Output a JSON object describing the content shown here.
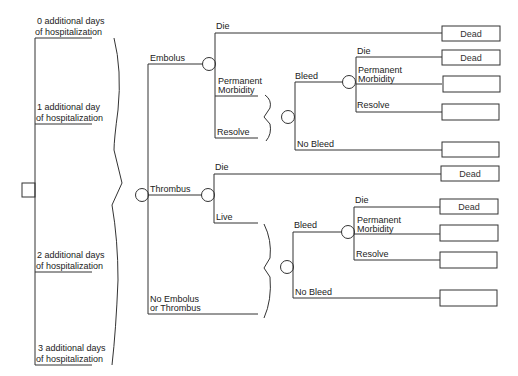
{
  "diagram": {
    "type": "decision-tree",
    "hospitalization_options": [
      {
        "line1": "0 additional days",
        "line2": "of hospitalization"
      },
      {
        "line1": "1 additional day",
        "line2": "of hospitalization"
      },
      {
        "line1": "2 additional days",
        "line2": "of hospitalization"
      },
      {
        "line1": "3 additional days",
        "line2": "of hospitalization"
      }
    ],
    "events": {
      "embolus": "Embolus",
      "thrombus": "Thrombus",
      "none_line1": "No Embolus",
      "none_line2": "or Thrombus"
    },
    "embolus_branch": {
      "die": "Die",
      "perm_line1": "Permanent",
      "perm_line2": "Morbidity",
      "resolve": "Resolve",
      "bleed": "Bleed",
      "no_bleed": "No Bleed",
      "bleed_die": "Die",
      "bleed_perm_line1": "Permanent",
      "bleed_perm_line2": "Morbidity",
      "bleed_resolve": "Resolve"
    },
    "thrombus_branch": {
      "die": "Die",
      "live": "Live",
      "bleed": "Bleed",
      "no_bleed": "No Bleed",
      "bleed_die": "Die",
      "bleed_perm_line1": "Permanent",
      "bleed_perm_line2": "Morbidity",
      "bleed_resolve": "Resolve"
    },
    "outcomes": [
      "Dead",
      "Dead",
      "",
      "",
      "",
      "Dead",
      "Dead",
      "",
      "",
      ""
    ]
  }
}
